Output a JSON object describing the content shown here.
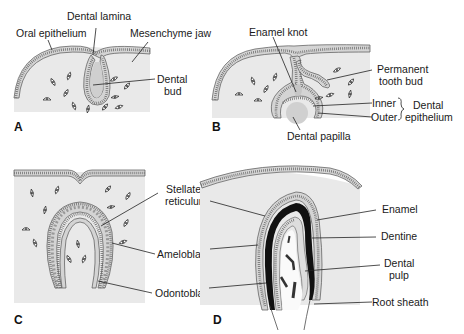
{
  "diagram": {
    "panels": [
      {
        "id": "A",
        "label": "A",
        "labels": {
          "oral_epithelium": "Oral epithelium",
          "dental_lamina": "Dental lamina",
          "mesenchyme_jaw": "Mesenchyme jaw",
          "dental_bud_line1": "Dental",
          "dental_bud_line2": "bud"
        }
      },
      {
        "id": "B",
        "label": "B",
        "labels": {
          "enamel_knot": "Enamel knot",
          "permanent_tooth_bud_line1": "Permanent",
          "permanent_tooth_bud_line2": "tooth bud",
          "inner": "Inner",
          "outer": "Outer",
          "dental_epithelium_line1": "Dental",
          "dental_epithelium_line2": "epithelium",
          "dental_papilla": "Dental papilla"
        }
      },
      {
        "id": "C",
        "label": "C",
        "labels": {
          "stellate_reticulum_line1": "Stellate",
          "stellate_reticulum_line2": "reticulum",
          "ameloblasts": "Ameloblasts",
          "odontoblasts": "Odontoblasts"
        }
      },
      {
        "id": "D",
        "label": "D",
        "labels": {
          "enamel": "Enamel",
          "dentine": "Dentine",
          "dental_pulp_line1": "Dental",
          "dental_pulp_line2": "pulp",
          "root_sheath": "Root sheath"
        }
      }
    ],
    "colors": {
      "tissue_fill": "#e9e9e9",
      "epithelium_fill": "#d4d4d4",
      "papilla_fill": "#d0d0d0",
      "enamel_fill": "#111111",
      "line": "#222222"
    }
  }
}
